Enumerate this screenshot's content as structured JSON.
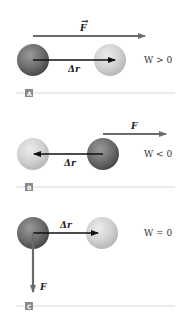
{
  "panels": [
    {
      "id": "A",
      "tag": "A",
      "force_label": "F",
      "displacement_label": "Δr",
      "work_label": "W > 0"
    },
    {
      "id": "B",
      "tag": "B",
      "force_label": "F",
      "displacement_label": "Δr",
      "work_label": "W < 0"
    },
    {
      "id": "C",
      "tag": "C",
      "force_label": "F",
      "displacement_label": "Δr",
      "work_label": "W = 0"
    }
  ],
  "colors": {
    "dark_ball": "#6e6e6e",
    "light_ball": "#d2d2d2",
    "force_arrow": "#6b6b6b",
    "displacement_arrow": "#111111",
    "divider": "#d8d8d8",
    "tag_bg": "#8a8a8a"
  }
}
